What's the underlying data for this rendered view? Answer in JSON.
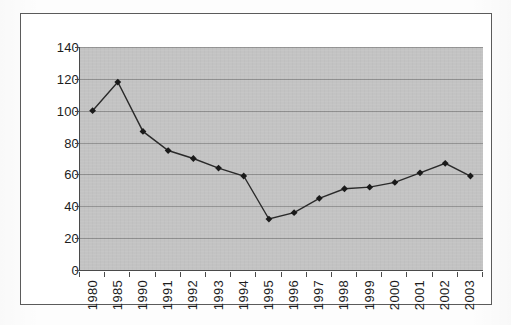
{
  "chart_data": {
    "type": "line",
    "title": "",
    "subtitle": "",
    "xlabel": "",
    "ylabel": "",
    "categories": [
      "1980",
      "1985",
      "1990",
      "1991",
      "1992",
      "1993",
      "1994",
      "1995",
      "1996",
      "1997",
      "1998",
      "1999",
      "2000",
      "2001",
      "2002",
      "2003"
    ],
    "values": [
      100,
      118,
      87,
      75,
      70,
      64,
      59,
      32,
      36,
      45,
      51,
      52,
      55,
      61,
      67,
      59
    ],
    "series": [
      {
        "name": "series-1",
        "values": [
          100,
          118,
          87,
          75,
          70,
          64,
          59,
          32,
          36,
          45,
          51,
          52,
          55,
          61,
          67,
          59
        ]
      }
    ],
    "ylim": [
      0,
      140
    ],
    "y_ticks": [
      0,
      20,
      40,
      60,
      80,
      100,
      120,
      140
    ],
    "y_tick_labels": [
      "0",
      "20",
      "40",
      "60",
      "80",
      "100",
      "120",
      "140"
    ],
    "grid": true,
    "grid_axis": "y",
    "legend": false,
    "legend_position": "none",
    "marker": "diamond",
    "x_tick_label_rotation": 90,
    "colors": {
      "plot_background": "#c2c2c2",
      "figure_background": "#ffffff",
      "gridline": "#8e8e8e",
      "axis": "#4a4a4a",
      "frame_border": "#5b5b5b",
      "series_line": "#2a2a2a",
      "marker_fill": "#1a1a1a",
      "tick_label": "#1d1d1d"
    }
  }
}
